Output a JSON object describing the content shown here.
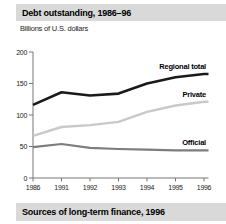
{
  "header": {
    "title": "Debt outstanding, 1986–96",
    "subtitle": "Billions of U.S. dollars"
  },
  "footer": {
    "title": "Sources of long-term finance, 1996"
  },
  "colors": {
    "band_bg": "#d9d9d9",
    "axis": "#777777",
    "tick_text": "#1a1a1a",
    "regional_total_line": "#1a1a1a",
    "private_line": "#c9c9c9",
    "official_line": "#7d7d7d"
  },
  "chart_data": {
    "type": "line",
    "title": "Debt outstanding, 1986–96",
    "ylabel": "Billions of U.S. dollars",
    "xlabel": "",
    "categories": [
      "1986",
      "1991",
      "1992",
      "1993",
      "1994",
      "1995",
      "1996"
    ],
    "y_ticks": [
      0,
      50,
      100,
      150,
      200
    ],
    "ylim": [
      0,
      200
    ],
    "grid": false,
    "legend_position": "inline-right-of-lines",
    "series": [
      {
        "name": "Regional total",
        "color": "#1a1a1a",
        "width": 2.6,
        "values": [
          116,
          136,
          131,
          134,
          150,
          160,
          165
        ]
      },
      {
        "name": "Private",
        "color": "#c9c9c9",
        "width": 2.4,
        "values": [
          67,
          81,
          84,
          89,
          105,
          115,
          121
        ]
      },
      {
        "name": "Official",
        "color": "#7d7d7d",
        "width": 2.2,
        "values": [
          49,
          54,
          48,
          46,
          45,
          44,
          44
        ]
      }
    ]
  }
}
